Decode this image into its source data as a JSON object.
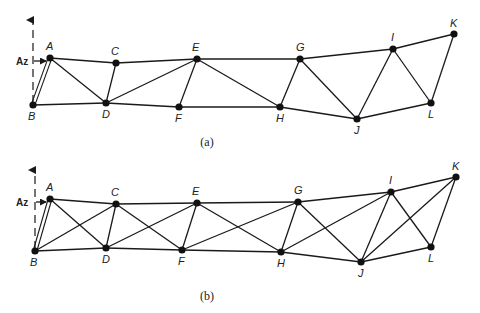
{
  "figures": [
    {
      "caption": "(a)",
      "caption_pos": [
        207,
        146
      ],
      "reaction": {
        "label": "Az",
        "label_pos": [
          16,
          65
        ],
        "arrow_x": 33,
        "arrow_top": 18,
        "arrow_bottom": 103,
        "pointer_from": [
          34,
          61
        ],
        "pointer_to": [
          46,
          61
        ]
      },
      "nodes": {
        "A": {
          "x": 50,
          "y": 58,
          "lx": 46,
          "ly": 50
        },
        "B": {
          "x": 33,
          "y": 105,
          "lx": 28,
          "ly": 120
        },
        "C": {
          "x": 116,
          "y": 63,
          "lx": 111,
          "ly": 55
        },
        "D": {
          "x": 106,
          "y": 103,
          "lx": 102,
          "ly": 118
        },
        "E": {
          "x": 197,
          "y": 59,
          "lx": 192,
          "ly": 51
        },
        "F": {
          "x": 179,
          "y": 107,
          "lx": 175,
          "ly": 122
        },
        "G": {
          "x": 300,
          "y": 59,
          "lx": 296,
          "ly": 51
        },
        "H": {
          "x": 280,
          "y": 107,
          "lx": 276,
          "ly": 122
        },
        "I": {
          "x": 393,
          "y": 49,
          "lx": 391,
          "ly": 41
        },
        "J": {
          "x": 357,
          "y": 119,
          "lx": 354,
          "ly": 134
        },
        "K": {
          "x": 454,
          "y": 34,
          "lx": 450,
          "ly": 27
        },
        "L": {
          "x": 431,
          "y": 103,
          "lx": 428,
          "ly": 118
        }
      },
      "double_members": [
        [
          "A",
          "B"
        ]
      ],
      "members": [
        [
          "A",
          "C"
        ],
        [
          "C",
          "E"
        ],
        [
          "E",
          "G"
        ],
        [
          "G",
          "I"
        ],
        [
          "I",
          "K"
        ],
        [
          "B",
          "D"
        ],
        [
          "D",
          "F"
        ],
        [
          "F",
          "H"
        ],
        [
          "H",
          "J"
        ],
        [
          "J",
          "L"
        ],
        [
          "L",
          "K"
        ],
        [
          "A",
          "D"
        ],
        [
          "C",
          "D"
        ],
        [
          "D",
          "E"
        ],
        [
          "E",
          "F"
        ],
        [
          "E",
          "H"
        ],
        [
          "G",
          "H"
        ],
        [
          "G",
          "J"
        ],
        [
          "I",
          "J"
        ],
        [
          "I",
          "L"
        ]
      ]
    },
    {
      "caption": "(b)",
      "caption_pos": [
        207,
        300
      ],
      "reaction": {
        "label": "Az",
        "label_pos": [
          16,
          206
        ],
        "arrow_x": 35,
        "arrow_top": 168,
        "arrow_bottom": 249,
        "pointer_from": [
          36,
          202
        ],
        "pointer_to": [
          46,
          202
        ]
      },
      "nodes": {
        "A": {
          "x": 50,
          "y": 199,
          "lx": 46,
          "ly": 191
        },
        "B": {
          "x": 35,
          "y": 251,
          "lx": 30,
          "ly": 266
        },
        "C": {
          "x": 116,
          "y": 204,
          "lx": 111,
          "ly": 196
        },
        "D": {
          "x": 106,
          "y": 248,
          "lx": 102,
          "ly": 263
        },
        "E": {
          "x": 197,
          "y": 203,
          "lx": 192,
          "ly": 195
        },
        "F": {
          "x": 182,
          "y": 250,
          "lx": 178,
          "ly": 265
        },
        "G": {
          "x": 298,
          "y": 202,
          "lx": 294,
          "ly": 194
        },
        "H": {
          "x": 281,
          "y": 252,
          "lx": 277,
          "ly": 267
        },
        "I": {
          "x": 391,
          "y": 192,
          "lx": 389,
          "ly": 184
        },
        "J": {
          "x": 361,
          "y": 262,
          "lx": 358,
          "ly": 277
        },
        "K": {
          "x": 456,
          "y": 177,
          "lx": 452,
          "ly": 170
        },
        "L": {
          "x": 431,
          "y": 247,
          "lx": 428,
          "ly": 262
        }
      },
      "double_members": [
        [
          "A",
          "B"
        ]
      ],
      "members": [
        [
          "A",
          "C"
        ],
        [
          "C",
          "E"
        ],
        [
          "E",
          "G"
        ],
        [
          "G",
          "I"
        ],
        [
          "I",
          "K"
        ],
        [
          "B",
          "D"
        ],
        [
          "D",
          "F"
        ],
        [
          "F",
          "H"
        ],
        [
          "H",
          "J"
        ],
        [
          "J",
          "L"
        ],
        [
          "L",
          "K"
        ],
        [
          "A",
          "D"
        ],
        [
          "B",
          "C"
        ],
        [
          "C",
          "D"
        ],
        [
          "C",
          "F"
        ],
        [
          "D",
          "E"
        ],
        [
          "E",
          "F"
        ],
        [
          "E",
          "H"
        ],
        [
          "F",
          "G"
        ],
        [
          "G",
          "H"
        ],
        [
          "G",
          "J"
        ],
        [
          "H",
          "I"
        ],
        [
          "I",
          "J"
        ],
        [
          "I",
          "L"
        ],
        [
          "J",
          "K"
        ]
      ]
    }
  ]
}
